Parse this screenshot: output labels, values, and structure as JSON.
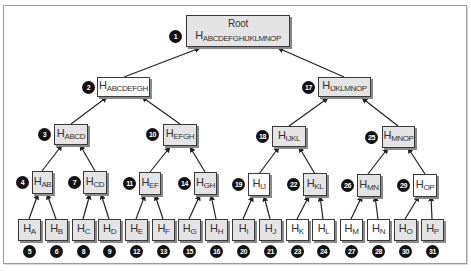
{
  "diagram": {
    "type": "merkle-tree",
    "colors": {
      "gray_node": "#e4e4e4",
      "white_node": "#ffffff",
      "badge": "#111111",
      "edge": "#222222"
    },
    "root": {
      "title": "Root",
      "hash": "H",
      "sub": "ABCDEFGHIJKLMNOP",
      "step": "1",
      "shade": "gray"
    },
    "level1": [
      {
        "hash": "H",
        "sub": "ABCDEFGH",
        "step": "2",
        "shade": "white"
      },
      {
        "hash": "H",
        "sub": "IJKLMNOP",
        "step": "17",
        "shade": "gray"
      }
    ],
    "level2": [
      {
        "hash": "H",
        "sub": "ABCD",
        "step": "3",
        "shade": "gray"
      },
      {
        "hash": "H",
        "sub": "EFGH",
        "step": "10",
        "shade": "gray"
      },
      {
        "hash": "H",
        "sub": "IJKL",
        "step": "18",
        "shade": "gray"
      },
      {
        "hash": "H",
        "sub": "MNOP",
        "step": "25",
        "shade": "gray"
      }
    ],
    "level3": [
      {
        "hash": "H",
        "sub": "AB",
        "step": "4",
        "shade": "gray"
      },
      {
        "hash": "H",
        "sub": "CD",
        "step": "7",
        "shade": "gray"
      },
      {
        "hash": "H",
        "sub": "EF",
        "step": "11",
        "shade": "gray"
      },
      {
        "hash": "H",
        "sub": "GH",
        "step": "14",
        "shade": "gray"
      },
      {
        "hash": "H",
        "sub": "IJ",
        "step": "19",
        "shade": "white"
      },
      {
        "hash": "H",
        "sub": "KL",
        "step": "22",
        "shade": "gray"
      },
      {
        "hash": "H",
        "sub": "MN",
        "step": "26",
        "shade": "gray"
      },
      {
        "hash": "H",
        "sub": "OP",
        "step": "29",
        "shade": "white"
      }
    ],
    "leaves": [
      {
        "hash": "H",
        "sub": "A",
        "step": "5",
        "shade": "gray"
      },
      {
        "hash": "H",
        "sub": "B",
        "step": "6",
        "shade": "gray"
      },
      {
        "hash": "H",
        "sub": "C",
        "step": "8",
        "shade": "gray"
      },
      {
        "hash": "H",
        "sub": "D",
        "step": "9",
        "shade": "gray"
      },
      {
        "hash": "H",
        "sub": "E",
        "step": "12",
        "shade": "gray"
      },
      {
        "hash": "H",
        "sub": "F",
        "step": "13",
        "shade": "gray"
      },
      {
        "hash": "H",
        "sub": "G",
        "step": "15",
        "shade": "gray"
      },
      {
        "hash": "H",
        "sub": "H",
        "step": "16",
        "shade": "gray"
      },
      {
        "hash": "H",
        "sub": "I",
        "step": "20",
        "shade": "gray"
      },
      {
        "hash": "H",
        "sub": "J",
        "step": "21",
        "shade": "gray"
      },
      {
        "hash": "H",
        "sub": "K",
        "step": "23",
        "shade": "white"
      },
      {
        "hash": "H",
        "sub": "L",
        "step": "24",
        "shade": "white"
      },
      {
        "hash": "H",
        "sub": "M",
        "step": "27",
        "shade": "white"
      },
      {
        "hash": "H",
        "sub": "N",
        "step": "28",
        "shade": "white"
      },
      {
        "hash": "H",
        "sub": "O",
        "step": "30",
        "shade": "gray"
      },
      {
        "hash": "H",
        "sub": "P",
        "step": "31",
        "shade": "gray"
      }
    ]
  }
}
